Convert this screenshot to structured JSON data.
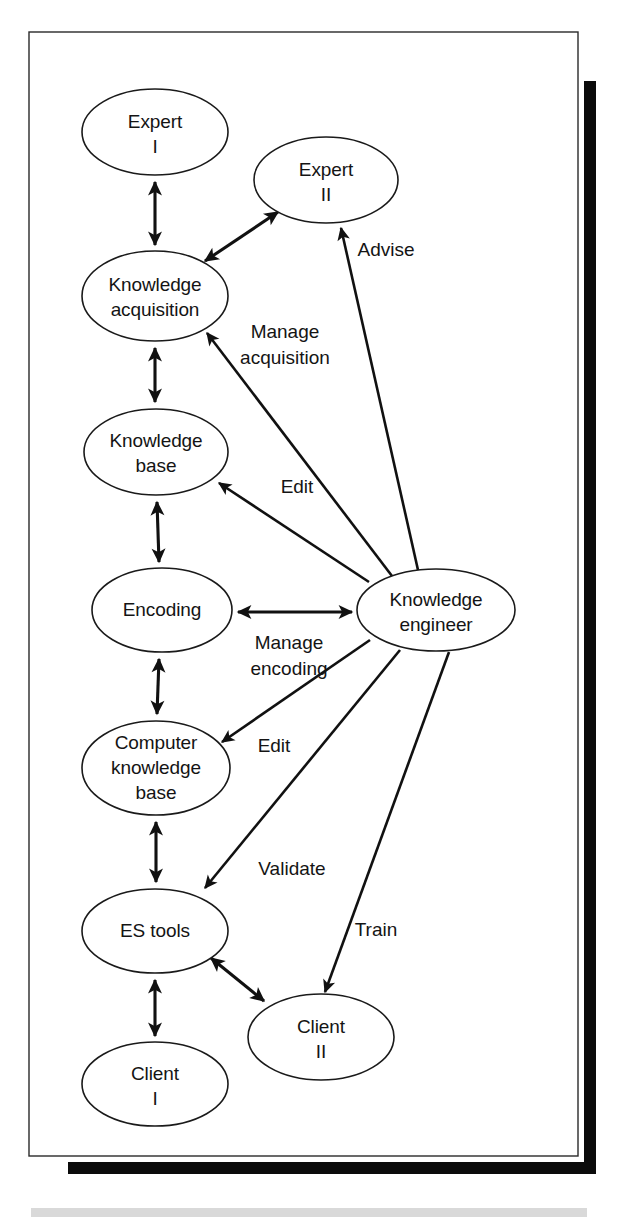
{
  "figure": {
    "background_color": "#ffffff",
    "frame_color": "#2a2a2a",
    "shadow_color": "#0b0b0b",
    "ink_color": "#141414"
  },
  "nodes": [
    {
      "id": "expert-1",
      "label_line1": "Expert",
      "label_line2": "I",
      "label_line3": "",
      "cx": 155,
      "cy": 132,
      "rx": 73,
      "ry": 43
    },
    {
      "id": "expert-2",
      "label_line1": "Expert",
      "label_line2": "II",
      "label_line3": "",
      "cx": 326,
      "cy": 180,
      "rx": 72,
      "ry": 43
    },
    {
      "id": "knowledge-acquisition",
      "label_line1": "Knowledge",
      "label_line2": "acquisition",
      "label_line3": "",
      "cx": 155,
      "cy": 296,
      "rx": 73,
      "ry": 45
    },
    {
      "id": "knowledge-base",
      "label_line1": "Knowledge",
      "label_line2": "base",
      "label_line3": "",
      "cx": 156,
      "cy": 452,
      "rx": 72,
      "ry": 43
    },
    {
      "id": "encoding",
      "label_line1": "Encoding",
      "label_line2": "",
      "label_line3": "",
      "cx": 162,
      "cy": 610,
      "rx": 70,
      "ry": 42
    },
    {
      "id": "computer-knowledge-base",
      "label_line1": "Computer",
      "label_line2": "knowledge",
      "label_line3": "base",
      "cx": 156,
      "cy": 768,
      "rx": 74,
      "ry": 47
    },
    {
      "id": "es-tools",
      "label_line1": "ES tools",
      "label_line2": "",
      "label_line3": "",
      "cx": 155,
      "cy": 931,
      "rx": 73,
      "ry": 42
    },
    {
      "id": "client-1",
      "label_line1": "Client",
      "label_line2": "I",
      "label_line3": "",
      "cx": 155,
      "cy": 1084,
      "rx": 73,
      "ry": 42
    },
    {
      "id": "client-2",
      "label_line1": "Client",
      "label_line2": "II",
      "label_line3": "",
      "cx": 321,
      "cy": 1037,
      "rx": 73,
      "ry": 43
    },
    {
      "id": "knowledge-engineer",
      "label_line1": "Knowledge",
      "label_line2": "engineer",
      "label_line3": "",
      "cx": 436,
      "cy": 610,
      "rx": 79,
      "ry": 41
    }
  ],
  "edges": [
    {
      "id": "expert1-acquisition",
      "label": "",
      "from": "expert-1",
      "to": "knowledge-acquisition",
      "arrows": "both"
    },
    {
      "id": "acquisition-expert2",
      "label": "",
      "from": "knowledge-acquisition",
      "to": "expert-2",
      "arrows": "both"
    },
    {
      "id": "acquisition-knowledgebase",
      "label": "",
      "from": "knowledge-acquisition",
      "to": "knowledge-base",
      "arrows": "both"
    },
    {
      "id": "knowledgebase-encoding",
      "label": "",
      "from": "knowledge-base",
      "to": "encoding",
      "arrows": "both"
    },
    {
      "id": "encoding-computerkb",
      "label": "",
      "from": "encoding",
      "to": "computer-knowledge-base",
      "arrows": "both"
    },
    {
      "id": "computerkb-estools",
      "label": "",
      "from": "computer-knowledge-base",
      "to": "es-tools",
      "arrows": "both"
    },
    {
      "id": "estools-client1",
      "label": "",
      "from": "es-tools",
      "to": "client-1",
      "arrows": "both"
    },
    {
      "id": "estools-client2",
      "label": "",
      "from": "es-tools",
      "to": "client-2",
      "arrows": "both"
    },
    {
      "id": "engineer-expert2-advise",
      "label": "Advise",
      "from": "knowledge-engineer",
      "to": "expert-2",
      "arrows": "single"
    },
    {
      "id": "engineer-acquisition-manage",
      "label": "Manage acquisition",
      "from": "knowledge-engineer",
      "to": "knowledge-acquisition",
      "arrows": "single"
    },
    {
      "id": "engineer-knowledgebase-edit",
      "label": "Edit",
      "from": "knowledge-engineer",
      "to": "knowledge-base",
      "arrows": "single"
    },
    {
      "id": "encoding-engineer-manage",
      "label": "Manage encoding",
      "from": "encoding",
      "to": "knowledge-engineer",
      "arrows": "both"
    },
    {
      "id": "engineer-computerkb-edit",
      "label": "Edit",
      "from": "knowledge-engineer",
      "to": "computer-knowledge-base",
      "arrows": "single"
    },
    {
      "id": "engineer-estools-validate",
      "label": "Validate",
      "from": "knowledge-engineer",
      "to": "es-tools",
      "arrows": "single"
    },
    {
      "id": "engineer-client2-train",
      "label": "Train",
      "from": "knowledge-engineer",
      "to": "client-2",
      "arrows": "single"
    }
  ],
  "edge_labels": [
    {
      "id": "advise",
      "text": "Advise",
      "x": 386,
      "y": 251
    },
    {
      "id": "manage-acquisition",
      "text": "Manage",
      "x": 285,
      "y": 333
    },
    {
      "id": "manage-acquisition2",
      "text": "acquisition",
      "x": 285,
      "y": 359
    },
    {
      "id": "edit-upper",
      "text": "Edit",
      "x": 297,
      "y": 488
    },
    {
      "id": "manage-encoding",
      "text": "Manage",
      "x": 289,
      "y": 644
    },
    {
      "id": "manage-encoding2",
      "text": "encoding",
      "x": 289,
      "y": 670
    },
    {
      "id": "edit-lower",
      "text": "Edit",
      "x": 274,
      "y": 747
    },
    {
      "id": "validate",
      "text": "Validate",
      "x": 292,
      "y": 870
    },
    {
      "id": "train",
      "text": "Train",
      "x": 376,
      "y": 931
    }
  ]
}
